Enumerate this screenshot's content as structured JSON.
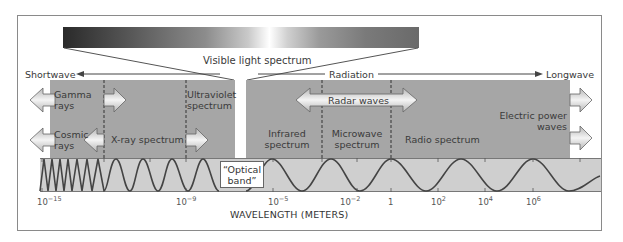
{
  "diagram": {
    "visible_light_label": "Visible light spectrum",
    "direction": {
      "left_label": "Shortwave",
      "center_label": "Radiation",
      "right_label": "Longwave"
    },
    "regions": {
      "gamma": "Gamma rays",
      "gamma_line1": "Gamma",
      "gamma_line2": "rays",
      "cosmic": "Cosmic rays",
      "cosmic_line1": "Cosmic",
      "cosmic_line2": "rays",
      "xray": "X-ray spectrum",
      "uv_line1": "Ultraviolet",
      "uv_line2": "spectrum",
      "infrared_line1": "Infrared",
      "infrared_line2": "spectrum",
      "microwave_line1": "Microwave",
      "microwave_line2": "spectrum",
      "radio": "Radio spectrum",
      "radar": "Radar waves",
      "electric_line1": "Electric power",
      "electric_line2": "waves"
    },
    "optical_band_line1": "“Optical",
    "optical_band_line2": "band”",
    "axis": {
      "title": "WAVELENGTH (METERS)",
      "ticks": [
        {
          "base": "10",
          "exp": "−15"
        },
        {
          "base": "10",
          "exp": "−9"
        },
        {
          "base": "10",
          "exp": "−5"
        },
        {
          "base": "10",
          "exp": "−2"
        },
        {
          "base": "1",
          "exp": ""
        },
        {
          "base": "10",
          "exp": "2"
        },
        {
          "base": "10",
          "exp": "4"
        },
        {
          "base": "10",
          "exp": "6"
        }
      ]
    },
    "colors": {
      "panel": "#a6a6a6",
      "waveband": "#cfcfcf",
      "wave_line": "#444444",
      "frame": "#8a8a8a"
    }
  }
}
